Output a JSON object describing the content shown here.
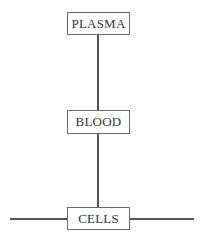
{
  "diagram": {
    "type": "hierarchy",
    "nodes": [
      {
        "id": "plasma",
        "label": "PLASMA"
      },
      {
        "id": "blood",
        "label": "BLOOD"
      },
      {
        "id": "cells",
        "label": "CELLS"
      }
    ],
    "edges": [
      {
        "from": "plasma",
        "to": "blood"
      },
      {
        "from": "blood",
        "to": "cells"
      }
    ],
    "cells_horizontal_line": true,
    "colors": {
      "line": "#555555",
      "border": "#6a6a6a",
      "text": "#333333",
      "background": "#ffffff"
    }
  }
}
